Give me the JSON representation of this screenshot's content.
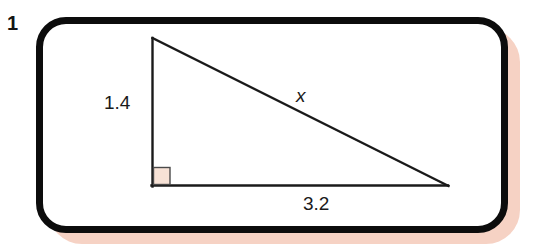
{
  "question": {
    "number": "1"
  },
  "figure": {
    "type": "right-triangle",
    "labels": {
      "vertical_side": "1.4",
      "bottom_side": "3.2",
      "hypotenuse": "x"
    },
    "right_angle_marker": "right-angle-square"
  },
  "colors": {
    "frame_border": "#0c0c0c",
    "frame_fill": "#ffffff",
    "drop_shadow": "#f6d2c4",
    "triangle_stroke": "#1a1a1a",
    "right_angle_fill": "#f7e2d6",
    "right_angle_stroke": "#4a4a4a",
    "text": "#1a1a1a",
    "page_background": "#ffffff"
  },
  "geometry": {
    "apex": [
      152,
      38
    ],
    "right_angle_vertex": [
      152,
      186
    ],
    "far_vertex": [
      448,
      186
    ],
    "vertical_leg_length_label": "1.4",
    "horizontal_leg_length_label": "3.2",
    "hypotenuse_label": "x"
  }
}
